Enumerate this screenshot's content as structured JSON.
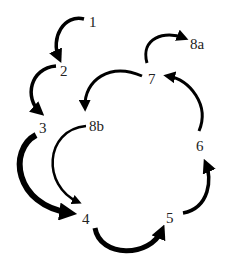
{
  "diagram": {
    "type": "cycle-flow",
    "nodes": [
      {
        "id": "1",
        "label": "1",
        "x": 95,
        "y": 25
      },
      {
        "id": "2",
        "label": "2",
        "x": 66,
        "y": 74
      },
      {
        "id": "3",
        "label": "3",
        "x": 45,
        "y": 131
      },
      {
        "id": "8b",
        "label": "8b",
        "x": 97,
        "y": 129
      },
      {
        "id": "4",
        "label": "4",
        "x": 88,
        "y": 222
      },
      {
        "id": "5",
        "label": "5",
        "x": 171,
        "y": 221
      },
      {
        "id": "6",
        "label": "6",
        "x": 201,
        "y": 149
      },
      {
        "id": "7",
        "label": "7",
        "x": 153,
        "y": 82
      },
      {
        "id": "8a",
        "label": "8a",
        "x": 197,
        "y": 47
      }
    ],
    "edges": [
      {
        "from": "1",
        "to": "2",
        "weight": "medium"
      },
      {
        "from": "2",
        "to": "3",
        "weight": "medium"
      },
      {
        "from": "3",
        "to": "4",
        "weight": "thick"
      },
      {
        "from": "8b",
        "to": "4",
        "weight": "medium"
      },
      {
        "from": "4",
        "to": "5",
        "weight": "thick"
      },
      {
        "from": "5",
        "to": "6",
        "weight": "medium"
      },
      {
        "from": "6",
        "to": "7",
        "weight": "medium"
      },
      {
        "from": "7",
        "to": "8a",
        "weight": "medium"
      },
      {
        "from": "7",
        "to": "8b",
        "weight": "medium"
      }
    ],
    "colors": {
      "arrow": "#000000",
      "label": "#222222",
      "background": "#ffffff"
    }
  }
}
